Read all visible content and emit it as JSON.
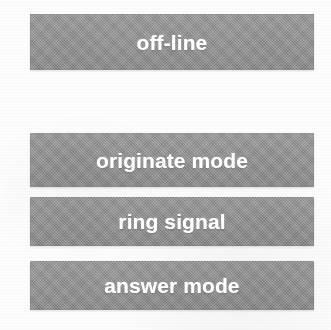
{
  "diagram": {
    "background_color": "#fdfdfd",
    "bar_color": "#949494",
    "label_color": "#ffffff",
    "bars": [
      {
        "id": "off-line",
        "label": "off-line"
      },
      {
        "id": "originate-mode",
        "label": "originate mode"
      },
      {
        "id": "ring-signal",
        "label": "ring signal"
      },
      {
        "id": "answer-mode",
        "label": "answer mode"
      }
    ]
  }
}
